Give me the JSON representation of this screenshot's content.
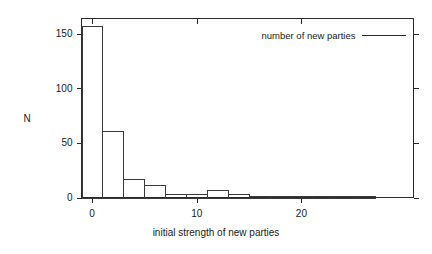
{
  "chart_data": {
    "type": "bar",
    "title": "",
    "subtitle": "",
    "xlabel": "initial strength of new parties",
    "ylabel": "N",
    "xlim": [
      -1,
      30.7
    ],
    "ylim": [
      0,
      164
    ],
    "grid": false,
    "legend_position": "top-right",
    "legend": [
      {
        "name": "number of new parties",
        "marker": "line"
      }
    ],
    "xticks": [
      0,
      10,
      20
    ],
    "xtick_labels": [
      "0",
      "10",
      "20"
    ],
    "yticks": [
      0,
      50,
      100,
      150
    ],
    "ytick_labels": [
      "0",
      "50",
      "100",
      "150"
    ],
    "bin_width": 2,
    "bins": [
      {
        "x0": -1,
        "x1": 1,
        "value": 157
      },
      {
        "x0": 1,
        "x1": 3,
        "value": 61
      },
      {
        "x0": 3,
        "x1": 5,
        "value": 17
      },
      {
        "x0": 5,
        "x1": 7,
        "value": 11
      },
      {
        "x0": 7,
        "x1": 9,
        "value": 3
      },
      {
        "x0": 9,
        "x1": 11,
        "value": 3
      },
      {
        "x0": 11,
        "x1": 13,
        "value": 7
      },
      {
        "x0": 13,
        "x1": 15,
        "value": 3
      },
      {
        "x0": 15,
        "x1": 17,
        "value": 1
      },
      {
        "x0": 17,
        "x1": 19,
        "value": 1
      },
      {
        "x0": 19,
        "x1": 21,
        "value": 1
      },
      {
        "x0": 21,
        "x1": 23,
        "value": 1
      },
      {
        "x0": 23,
        "x1": 25,
        "value": 1
      },
      {
        "x0": 25,
        "x1": 27,
        "value": 1
      }
    ],
    "categories": [
      "-1 to 1",
      "1 to 3",
      "3 to 5",
      "5 to 7",
      "7 to 9",
      "9 to 11",
      "11 to 13",
      "13 to 15",
      "15 to 17",
      "17 to 19",
      "19 to 21",
      "21 to 23",
      "23 to 25",
      "25 to 27"
    ],
    "values": [
      157,
      61,
      17,
      11,
      3,
      3,
      7,
      3,
      1,
      1,
      1,
      1,
      1,
      1
    ],
    "colors": {
      "axis": "#2a2a2a",
      "bar_stroke": "#3a3a3a",
      "bar_fill": "none",
      "text": "#1a1a1a",
      "background": "#ffffff"
    }
  }
}
